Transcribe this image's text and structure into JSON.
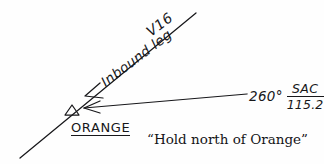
{
  "diagram": {
    "ink_color": "#17171a",
    "background_color": "#fefefe",
    "airway": {
      "label": "V16",
      "leg_label": "Inbound leg"
    },
    "fix": {
      "name": "ORANGE",
      "marker": "triangle-fix-marker"
    },
    "radial": {
      "bearing": "260°",
      "navaid_ident": "SAC",
      "navaid_frequency": "115.2"
    },
    "caption": "“Hold north of Orange”"
  }
}
